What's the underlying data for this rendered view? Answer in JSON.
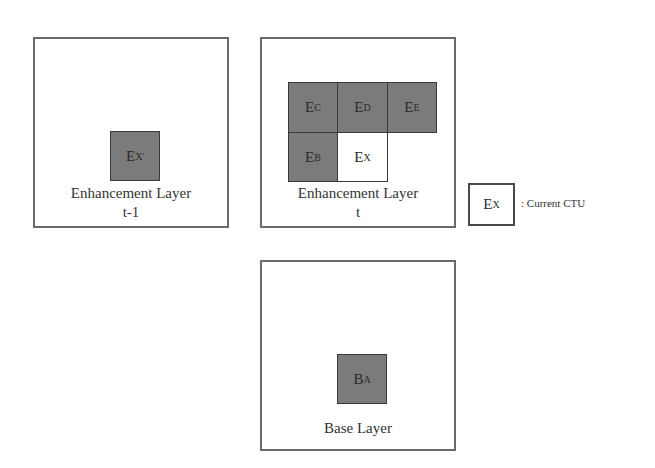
{
  "panels": {
    "enh_prev": {
      "caption_line1": "Enhancement Layer",
      "caption_line2": "t-1",
      "block": {
        "base": "E",
        "sub": "X",
        "sup": "'"
      }
    },
    "enh_curr": {
      "caption_line1": "Enhancement Layer",
      "caption_line2": "t",
      "blocks": [
        {
          "base": "E",
          "sub": "C",
          "shade": "dark"
        },
        {
          "base": "E",
          "sub": "D",
          "shade": "dark"
        },
        {
          "base": "E",
          "sub": "E",
          "shade": "dark"
        },
        {
          "base": "E",
          "sub": "B",
          "shade": "dark"
        },
        {
          "base": "E",
          "sub": "X",
          "shade": "light"
        }
      ]
    },
    "base": {
      "caption": "Base Layer",
      "block": {
        "base": "B",
        "sub": "A"
      }
    }
  },
  "legend": {
    "block": {
      "base": "E",
      "sub": "X"
    },
    "label": ": Current CTU"
  },
  "colors": {
    "dark_block": "#7b7b7b",
    "light_block": "#ffffff",
    "frame_border": "#6a6a6a"
  }
}
